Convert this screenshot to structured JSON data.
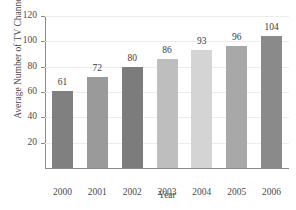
{
  "chart_data": {
    "type": "bar",
    "title": "",
    "xlabel": "Year",
    "ylabel": "Average Number of TV Channels",
    "categories": [
      "2000",
      "2001",
      "2002",
      "2003",
      "2004",
      "2005",
      "2006"
    ],
    "values": [
      61,
      72,
      80,
      86,
      93,
      96,
      104
    ],
    "value_labels": [
      "61",
      "72",
      "80",
      "86",
      "93",
      "96",
      "104"
    ],
    "bar_colors": [
      "#808080",
      "#9a9a9a",
      "#7c7c7c",
      "#bebebe",
      "#d4d4d4",
      "#a8a8a8",
      "#8a8a8a"
    ],
    "ylim": [
      0,
      120
    ],
    "yticks": [
      20,
      40,
      60,
      80,
      100,
      120
    ],
    "ytick_labels": [
      "20",
      "40",
      "60",
      "80",
      "100",
      "120"
    ],
    "grid": true,
    "legend": "none",
    "gridline_color": "#ececec",
    "axis_color": "#8c8c8c",
    "text_color": "#3a3a3a",
    "background": "#ffffff"
  }
}
